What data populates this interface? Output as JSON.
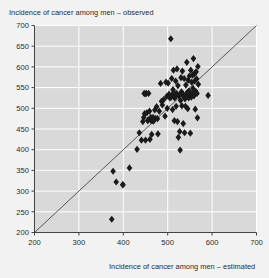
{
  "chart_data": {
    "type": "scatter",
    "title": "",
    "xlabel": "Incidence of cancer among men – estimated",
    "ylabel": "Incidence of cancer among men – observed",
    "xlim": [
      200,
      700
    ],
    "ylim": [
      200,
      700
    ],
    "xticks": [
      200,
      300,
      400,
      500,
      600,
      700
    ],
    "yticks": [
      200,
      250,
      300,
      350,
      400,
      450,
      500,
      550,
      600,
      650,
      700
    ],
    "grid": true,
    "grid_color": "#ffffff",
    "plot_background": "#d9d9d9",
    "page_background": "#f2f2f2",
    "marker": "diamond",
    "marker_color": "#1a1a1a",
    "marker_size": 3.6,
    "legend": null,
    "reference_line": {
      "name": "identity-line",
      "label": "y = x",
      "from": [
        200,
        200
      ],
      "to": [
        700,
        700
      ],
      "color": "#333333",
      "width": 0.8
    },
    "points": [
      [
        374,
        232
      ],
      [
        377,
        348
      ],
      [
        384,
        322
      ],
      [
        399,
        315
      ],
      [
        399,
        316
      ],
      [
        414,
        356
      ],
      [
        431,
        401
      ],
      [
        436,
        441
      ],
      [
        441,
        423
      ],
      [
        444,
        468
      ],
      [
        446,
        478
      ],
      [
        447,
        536
      ],
      [
        448,
        487
      ],
      [
        449,
        535
      ],
      [
        450,
        423
      ],
      [
        452,
        536
      ],
      [
        453,
        489
      ],
      [
        455,
        470
      ],
      [
        456,
        472
      ],
      [
        457,
        536
      ],
      [
        459,
        493
      ],
      [
        460,
        425
      ],
      [
        461,
        473
      ],
      [
        462,
        478
      ],
      [
        463,
        470
      ],
      [
        464,
        437
      ],
      [
        465,
        472
      ],
      [
        466,
        471
      ],
      [
        467,
        478
      ],
      [
        468,
        469
      ],
      [
        470,
        473
      ],
      [
        471,
        496
      ],
      [
        473,
        476
      ],
      [
        475,
        504
      ],
      [
        477,
        475
      ],
      [
        478,
        438
      ],
      [
        481,
        493
      ],
      [
        484,
        560
      ],
      [
        486,
        517
      ],
      [
        488,
        508
      ],
      [
        491,
        521
      ],
      [
        494,
        481
      ],
      [
        496,
        563
      ],
      [
        498,
        529
      ],
      [
        499,
        500
      ],
      [
        501,
        561
      ],
      [
        503,
        534
      ],
      [
        505,
        525
      ],
      [
        507,
        668
      ],
      [
        508,
        527
      ],
      [
        509,
        572
      ],
      [
        510,
        533
      ],
      [
        511,
        497
      ],
      [
        512,
        545
      ],
      [
        513,
        592
      ],
      [
        514,
        528
      ],
      [
        515,
        470
      ],
      [
        516,
        525
      ],
      [
        517,
        535
      ],
      [
        518,
        566
      ],
      [
        519,
        505
      ],
      [
        520,
        536
      ],
      [
        521,
        595
      ],
      [
        522,
        468
      ],
      [
        523,
        555
      ],
      [
        524,
        430
      ],
      [
        525,
        530
      ],
      [
        526,
        532
      ],
      [
        527,
        444
      ],
      [
        528,
        399
      ],
      [
        529,
        519
      ],
      [
        530,
        574
      ],
      [
        531,
        540
      ],
      [
        532,
        506
      ],
      [
        533,
        590
      ],
      [
        534,
        534
      ],
      [
        535,
        463
      ],
      [
        536,
        528
      ],
      [
        537,
        572
      ],
      [
        538,
        441
      ],
      [
        539,
        523
      ],
      [
        540,
        505
      ],
      [
        541,
        556
      ],
      [
        542,
        531
      ],
      [
        543,
        611
      ],
      [
        544,
        538
      ],
      [
        545,
        499
      ],
      [
        546,
        568
      ],
      [
        547,
        525
      ],
      [
        548,
        542
      ],
      [
        549,
        578
      ],
      [
        550,
        533
      ],
      [
        551,
        440
      ],
      [
        552,
        592
      ],
      [
        553,
        527
      ],
      [
        554,
        563
      ],
      [
        555,
        536
      ],
      [
        556,
        580
      ],
      [
        557,
        548
      ],
      [
        558,
        620
      ],
      [
        559,
        530
      ],
      [
        560,
        583
      ],
      [
        561,
        566
      ],
      [
        562,
        498
      ],
      [
        563,
        541
      ],
      [
        564,
        588
      ],
      [
        565,
        571
      ],
      [
        566,
        536
      ],
      [
        567,
        477
      ],
      [
        568,
        601
      ],
      [
        569,
        558
      ],
      [
        591,
        531
      ]
    ]
  }
}
